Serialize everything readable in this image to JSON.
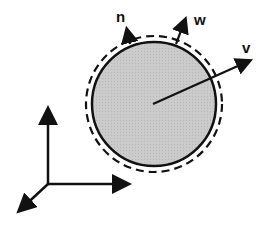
{
  "diagram": {
    "labels": {
      "n": "n",
      "w": "w",
      "v": "v"
    },
    "colors": {
      "fill": "#c8c8c8",
      "stroke": "#111111",
      "background": "#ffffff"
    },
    "body": {
      "shape": "circle",
      "fill_description": "gray particle",
      "boundary": "dashed outer layer"
    },
    "vectors": [
      {
        "name": "n",
        "description": "normal vector at surface"
      },
      {
        "name": "w",
        "description": "surface velocity vector"
      },
      {
        "name": "v",
        "description": "velocity vector from center"
      }
    ],
    "axes": {
      "count": 3,
      "description": "3D coordinate axes (up, right, down-left)"
    }
  }
}
